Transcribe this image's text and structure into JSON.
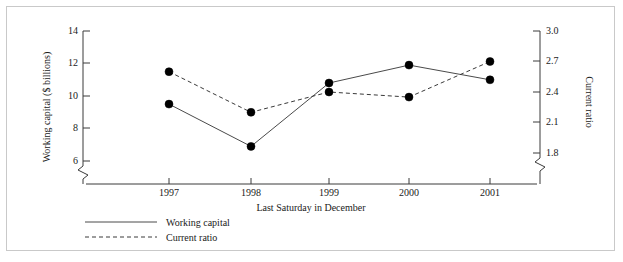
{
  "chart_data": {
    "type": "line",
    "title": "",
    "xlabel": "Last Saturday in December",
    "categories": [
      "1997",
      "1998",
      "1999",
      "2000",
      "2001"
    ],
    "grid": false,
    "legend_position": "bottom-left",
    "axes": {
      "left": {
        "label": "Working capital ($ billions)",
        "ticks": [
          "6",
          "8",
          "10",
          "12",
          "14"
        ],
        "tick_values": [
          6,
          8,
          10,
          12,
          14
        ],
        "ylim": [
          6,
          14
        ],
        "axis_break": true
      },
      "right": {
        "label": "Current ratio",
        "ticks": [
          "1.8",
          "2.1",
          "2.4",
          "2.7",
          "3.0"
        ],
        "tick_values": [
          1.8,
          2.1,
          2.4,
          2.7,
          3.0
        ],
        "ylim": [
          1.8,
          3.0
        ],
        "axis_break": true
      }
    },
    "series": [
      {
        "name": "Working capital",
        "axis": "left",
        "style": "solid",
        "marker": "filled-circle",
        "values": [
          9.5,
          6.9,
          10.8,
          11.9,
          11.0
        ]
      },
      {
        "name": "Current ratio",
        "axis": "right",
        "style": "dashed",
        "marker": "filled-circle",
        "values": [
          2.6,
          2.2,
          2.4,
          2.35,
          2.7
        ]
      }
    ]
  },
  "legend": {
    "items": [
      {
        "label": "Working capital",
        "style": "solid"
      },
      {
        "label": "Current ratio",
        "style": "dashed"
      }
    ]
  },
  "colors": {
    "line_solid": "#4a4a4a",
    "line_dashed": "#3a3a3a",
    "marker": "#000000",
    "axis": "#3a3a3a",
    "frame": "#c9c9c9",
    "background": "#ffffff"
  }
}
